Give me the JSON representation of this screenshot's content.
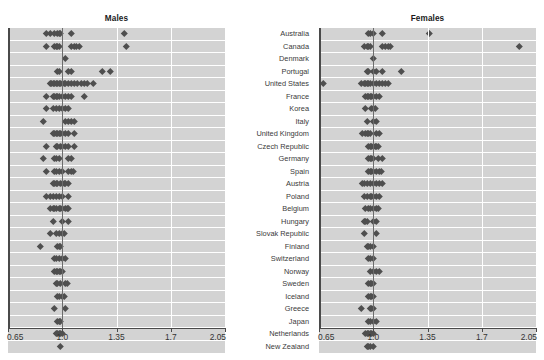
{
  "figure": {
    "caption": "",
    "footnote": "",
    "reference_value": 1.0,
    "accent_color": "#4f4f4f",
    "band_color": "#d3d3d3",
    "grid_color": "#ffffff",
    "axis_color": "#4a4a4a"
  },
  "panels": {
    "males": {
      "title": "Males"
    },
    "females": {
      "title": "Females"
    }
  },
  "axis": {
    "ticks": [
      "0.65",
      "1.0",
      "1.35",
      "1.7",
      "2.05"
    ],
    "min": 0.65,
    "max": 2.05
  },
  "countries": [
    "Australia",
    "Canada",
    "Denmark",
    "Portugal",
    "United States",
    "France",
    "Korea",
    "Italy",
    "United Kingdom",
    "Czech Republic",
    "Germany",
    "Spain",
    "Austria",
    "Poland",
    "Belgium",
    "Hungary",
    "Slovak Republic",
    "Finland",
    "Switzerland",
    "Norway",
    "Sweden",
    "Iceland",
    "Greece",
    "Japan",
    "Netherlands",
    "New Zealand"
  ],
  "chart_data": {
    "type": "scatter",
    "title": "",
    "xlabel": "",
    "ylabel": "",
    "xlim": [
      0.65,
      2.05
    ],
    "xticks": [
      0.65,
      1.0,
      1.35,
      1.7,
      2.05
    ],
    "grid": true,
    "legend": "none",
    "reference_line": 1.0,
    "categories": [
      "Australia",
      "Canada",
      "Denmark",
      "Portugal",
      "United States",
      "France",
      "Korea",
      "Italy",
      "United Kingdom",
      "Czech Republic",
      "Germany",
      "Spain",
      "Austria",
      "Poland",
      "Belgium",
      "Hungary",
      "Slovak Republic",
      "Finland",
      "Switzerland",
      "Norway",
      "Sweden",
      "Iceland",
      "Greece",
      "Japan",
      "Netherlands",
      "New Zealand"
    ],
    "series": [
      {
        "name": "Males",
        "panel": "males",
        "points": [
          [
            0.9,
            0.92,
            0.95,
            0.97,
            0.98,
            0.99,
            1.06,
            1.4
          ],
          [
            0.9,
            0.95,
            0.96,
            0.97,
            0.98,
            1.06,
            1.08,
            1.09,
            1.11,
            1.41
          ],
          [
            1.02
          ],
          [
            0.97,
            0.98,
            1.04,
            1.06,
            1.26,
            1.31
          ],
          [
            0.92,
            0.93,
            0.94,
            0.95,
            0.96,
            0.97,
            0.98,
            0.99,
            1.0,
            1.01,
            1.02,
            1.04,
            1.06,
            1.08,
            1.1,
            1.12,
            1.14,
            1.16,
            1.2
          ],
          [
            0.9,
            0.94,
            0.95,
            0.96,
            0.97,
            0.98,
            1.0,
            1.02,
            1.04,
            1.06,
            1.14
          ],
          [
            0.9,
            0.94,
            0.96,
            0.98,
            1.0,
            1.02,
            1.04
          ],
          [
            0.88,
            1.02,
            1.04,
            1.06,
            1.08
          ],
          [
            0.94,
            0.95,
            0.96,
            0.97,
            0.98,
            0.99,
            1.0,
            1.02,
            1.04,
            1.08
          ],
          [
            0.9,
            0.96,
            0.97,
            0.99,
            1.0,
            1.02,
            1.04,
            1.08
          ],
          [
            0.88,
            0.95,
            0.96,
            0.98,
            1.04,
            1.06
          ],
          [
            0.9,
            0.95,
            0.96,
            0.98,
            1.0,
            1.04,
            1.06,
            1.07
          ],
          [
            0.94,
            0.95,
            0.96,
            0.97,
            0.99,
            1.0,
            1.01,
            1.02,
            1.04
          ],
          [
            0.9,
            0.92,
            0.94,
            0.96,
            0.98,
            1.0,
            1.04
          ],
          [
            0.92,
            0.94,
            0.95,
            0.96,
            0.98,
            0.99,
            1.0,
            1.02,
            1.03,
            1.04
          ],
          [
            0.94,
            1.0,
            1.04
          ],
          [
            0.92,
            0.96,
            0.98,
            1.0,
            1.01
          ],
          [
            0.86,
            0.97,
            0.98,
            0.99
          ],
          [
            0.95,
            0.96,
            0.98,
            1.0,
            1.02
          ],
          [
            0.95,
            0.96,
            0.97,
            0.98,
            0.99,
            1.0
          ],
          [
            0.96,
            0.97,
            0.99,
            1.02,
            1.03
          ],
          [
            0.97,
            0.98,
            1.0,
            1.01
          ],
          [
            0.95,
            1.02
          ],
          [
            0.97,
            0.98,
            0.99
          ],
          [
            0.96,
            0.97,
            0.98,
            0.99,
            1.0
          ],
          [
            0.99
          ]
        ]
      },
      {
        "name": "Females",
        "panel": "females",
        "points": [
          [
            0.97,
            0.98,
            1.0,
            1.06,
            1.36
          ],
          [
            0.94,
            0.96,
            0.97,
            0.98,
            1.06,
            1.08,
            1.1,
            1.11,
            1.94
          ],
          [
            1.0
          ],
          [
            0.96,
            0.97,
            1.0,
            1.02,
            1.06,
            1.18
          ],
          [
            0.68,
            0.92,
            0.94,
            0.95,
            0.96,
            0.97,
            0.98,
            1.0,
            1.02,
            1.04,
            1.06,
            1.08,
            1.1
          ],
          [
            0.95,
            0.96,
            0.97,
            0.98,
            0.99,
            1.0,
            1.02,
            1.04
          ],
          [
            0.95,
            0.99,
            1.0,
            1.01
          ],
          [
            0.96,
            1.0,
            1.02
          ],
          [
            0.93,
            0.95,
            0.96,
            0.97,
            0.98,
            1.02,
            1.04
          ],
          [
            0.97,
            0.98,
            0.99,
            1.0,
            1.01,
            1.02,
            1.03
          ],
          [
            0.97,
            0.98,
            0.99,
            1.0,
            1.03,
            1.06
          ],
          [
            0.97,
            0.98,
            0.99,
            1.0,
            1.02,
            1.04,
            1.05
          ],
          [
            0.93,
            0.94,
            0.96,
            0.98,
            1.0,
            1.02,
            1.04,
            1.06
          ],
          [
            0.94,
            0.96,
            0.98,
            0.99,
            1.0,
            1.02,
            1.04
          ],
          [
            0.95,
            0.97,
            0.98,
            1.0,
            1.02,
            1.03
          ],
          [
            0.94,
            0.95,
            0.96,
            1.0,
            1.02
          ],
          [
            0.94,
            1.02
          ],
          [
            0.96,
            0.97,
            0.98,
            1.0
          ],
          [
            0.97,
            0.98,
            1.0
          ],
          [
            0.98,
            1.0,
            1.02,
            1.04
          ],
          [
            0.97,
            0.98,
            0.99,
            1.0
          ],
          [
            0.97,
            0.98,
            0.99,
            1.0
          ],
          [
            0.92,
            0.98,
            0.99,
            1.0
          ],
          [
            0.97,
            0.98,
            1.0,
            1.02
          ],
          [
            0.95,
            0.96,
            0.97,
            0.98,
            0.99,
            1.0
          ],
          [
            0.96,
            0.97,
            0.98,
            1.0
          ],
          [
            0.98,
            1.0
          ]
        ]
      }
    ]
  }
}
